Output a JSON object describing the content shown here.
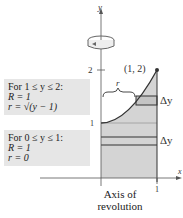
{
  "diagram": {
    "axis_y_label": "y",
    "axis_x_label": "x",
    "tick_y_2": "2",
    "tick_y_1": "1",
    "tick_x_1": "1",
    "point_label": "(1, 2)",
    "r_label": "r",
    "delta_top": "Δy",
    "delta_bottom": "Δy",
    "caption_line1": "Axis of",
    "caption_line2": "revolution",
    "colors": {
      "shade": "#d4d4d4",
      "box": "#e6e6e6",
      "line": "#333333"
    }
  },
  "box_upper": {
    "line1": "For 1 ≤ y ≤ 2:",
    "line2": "R = 1",
    "line3": "r = √(y − 1)"
  },
  "box_lower": {
    "line1": "For 0 ≤ y ≤ 1:",
    "line2": "R = 1",
    "line3": "r = 0"
  }
}
